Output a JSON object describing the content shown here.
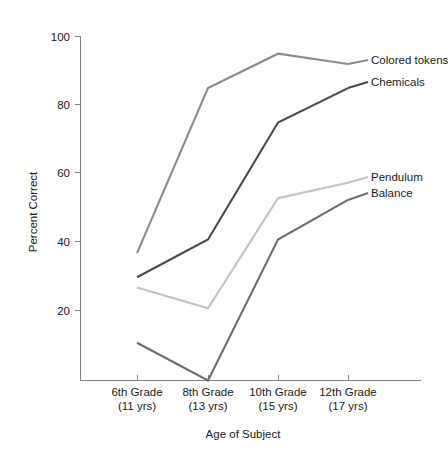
{
  "chart_data": {
    "type": "line",
    "title": "",
    "xlabel": "Age of Subject",
    "ylabel": "Percent Correct",
    "categories": [
      "6th Grade\n(11 yrs)",
      "8th Grade\n(13 yrs)",
      "10th Grade\n(15 yrs)",
      "12th Grade\n(17 yrs)"
    ],
    "category_lines": [
      {
        "line1": "6th Grade",
        "line2": "(11 yrs)"
      },
      {
        "line1": "8th Grade",
        "line2": "(13 yrs)"
      },
      {
        "line1": "10th Grade",
        "line2": "(15 yrs)"
      },
      {
        "line1": "12th Grade",
        "line2": "(17 yrs)"
      }
    ],
    "ylim": [
      0,
      100
    ],
    "yticks": [
      20,
      40,
      60,
      80,
      100
    ],
    "ytick_labels": [
      "20",
      "40",
      "60",
      "80",
      "100"
    ],
    "grid": false,
    "legend_position": "right-inline-labels",
    "series": [
      {
        "name": "Colored tokens",
        "values": [
          37,
          85,
          95,
          92
        ],
        "color": "#8c8c8c"
      },
      {
        "name": "Chemicals",
        "values": [
          30,
          41,
          75,
          85
        ],
        "color": "#4a4a4a"
      },
      {
        "name": "Pendulum",
        "values": [
          27,
          21,
          53,
          57.5
        ],
        "color": "#c4c4c4"
      },
      {
        "name": "Balance",
        "values": [
          11,
          0,
          41,
          52.5
        ],
        "color": "#6f6f6f"
      }
    ]
  },
  "axes": {
    "y_title": "Percent Correct",
    "x_title": "Age of Subject"
  },
  "labels": {
    "colored_tokens": "Colored tokens",
    "chemicals": "Chemicals",
    "pendulum": "Pendulum",
    "balance": "Balance"
  },
  "yticks": {
    "t100": "100",
    "t80": "80",
    "t60": "60",
    "t40": "40",
    "t20": "20"
  },
  "xticks": {
    "c0l1": "6th Grade",
    "c0l2": "(11 yrs)",
    "c1l1": "8th Grade",
    "c1l2": "(13 yrs)",
    "c2l1": "10th Grade",
    "c2l2": "(15 yrs)",
    "c3l1": "12th Grade",
    "c3l2": "(17 yrs)"
  }
}
